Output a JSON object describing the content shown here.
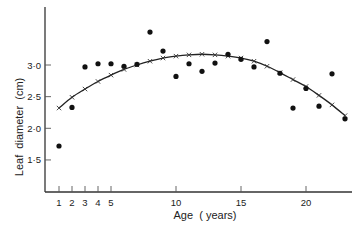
{
  "chart_data": {
    "type": "scatter",
    "title": "",
    "xlabel": "Age  ( years)",
    "ylabel": "Leaf  diameter  (cm)",
    "xlim": [
      0,
      23.5
    ],
    "ylim": [
      1.0,
      3.9
    ],
    "grid": false,
    "legend": "none",
    "x_ticks": [
      1,
      2,
      3,
      4,
      5,
      10,
      15,
      20
    ],
    "x_tick_labels": [
      "1",
      "2",
      "3",
      "4",
      "5",
      "10",
      "15",
      "20"
    ],
    "y_ticks": [
      1.5,
      2.0,
      2.5,
      3.0
    ],
    "y_tick_labels": [
      "1·5",
      "2·0",
      "2·5",
      "3·0"
    ],
    "series": [
      {
        "name": "observed",
        "marker": "filled-circle",
        "x": [
          1,
          2,
          3,
          4,
          5,
          6,
          7,
          8,
          9,
          10,
          11,
          12,
          13,
          14,
          15,
          16,
          17,
          18,
          19,
          20,
          21,
          22,
          23
        ],
        "values": [
          1.72,
          2.33,
          2.97,
          3.02,
          3.02,
          2.98,
          3.01,
          3.52,
          3.22,
          2.82,
          3.02,
          2.9,
          3.03,
          3.17,
          3.09,
          2.97,
          3.37,
          2.87,
          2.32,
          2.63,
          2.35,
          2.86,
          2.15
        ]
      },
      {
        "name": "fitted curve",
        "marker": "x",
        "line": true,
        "x": [
          1,
          2,
          3,
          4,
          5,
          6,
          7,
          8,
          9,
          10,
          11,
          12,
          13,
          14,
          15,
          16,
          17,
          18,
          19,
          20,
          21,
          22,
          23
        ],
        "values": [
          2.32,
          2.49,
          2.62,
          2.74,
          2.84,
          2.93,
          3.0,
          3.06,
          3.11,
          3.14,
          3.16,
          3.17,
          3.16,
          3.14,
          3.11,
          3.06,
          2.98,
          2.88,
          2.77,
          2.66,
          2.52,
          2.37,
          2.2
        ]
      }
    ]
  }
}
